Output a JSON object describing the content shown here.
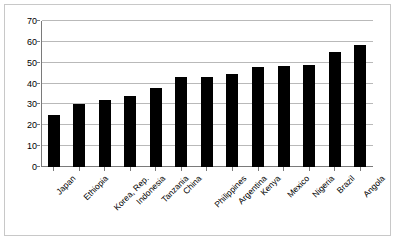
{
  "chart_data": {
    "type": "bar",
    "title": "",
    "subtitle": "",
    "xlabel": "",
    "ylabel": "",
    "ylim": [
      0,
      70
    ],
    "ytick_step": 10,
    "yticks": [
      0,
      10,
      20,
      30,
      40,
      50,
      60,
      70
    ],
    "grid": true,
    "legend": false,
    "legend_position": "none",
    "bar_color": "#000000",
    "gridline_color": "#b9b9b9",
    "axis_color": "#7a7a7a",
    "border_color": "#c8c8c8",
    "categories": [
      "Japan",
      "Ethiopia",
      "Korea, Rep.",
      "Indonesia",
      "Tanzania",
      "China",
      "Philippines",
      "Argentina",
      "Kenya",
      "Mexico",
      "Nigeria",
      "Brazil",
      "Angola"
    ],
    "values": [
      25,
      30,
      32,
      34,
      38,
      43,
      43,
      44.5,
      48,
      48.5,
      49,
      55,
      58.5
    ]
  }
}
